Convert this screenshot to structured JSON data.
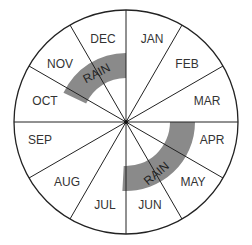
{
  "diagram": {
    "type": "month-wheel",
    "center": [
      126,
      122
    ],
    "radius": 112,
    "months": [
      {
        "label": "JAN",
        "pos": [
          152,
          40
        ]
      },
      {
        "label": "FEB",
        "pos": [
          187,
          65
        ]
      },
      {
        "label": "MAR",
        "pos": [
          207,
          102
        ]
      },
      {
        "label": "APR",
        "pos": [
          212,
          141
        ]
      },
      {
        "label": "MAY",
        "pos": [
          193,
          183
        ]
      },
      {
        "label": "JUN",
        "pos": [
          150,
          206
        ]
      },
      {
        "label": "JUL",
        "pos": [
          105,
          206
        ]
      },
      {
        "label": "AUG",
        "pos": [
          67,
          183
        ]
      },
      {
        "label": "SEP",
        "pos": [
          40,
          141
        ]
      },
      {
        "label": "OCT",
        "pos": [
          45,
          102
        ]
      },
      {
        "label": "NOV",
        "pos": [
          60,
          65
        ]
      },
      {
        "label": "DEC",
        "pos": [
          103,
          40
        ]
      }
    ],
    "rain_bands": [
      {
        "label": "RAIN",
        "start_deg": 90,
        "end_deg": 155,
        "inner_r": 44,
        "outer_r": 69,
        "label_pos": [
          97,
          74
        ],
        "label_rot": -28
      },
      {
        "label": "RAIN",
        "start_deg": 0,
        "end_deg": -93,
        "inner_r": 44,
        "outer_r": 69,
        "label_pos": [
          157,
          174
        ],
        "label_rot": -40
      }
    ],
    "colors": {
      "line": "#222222",
      "band": "#8a8a8a",
      "background": "#ffffff"
    }
  }
}
